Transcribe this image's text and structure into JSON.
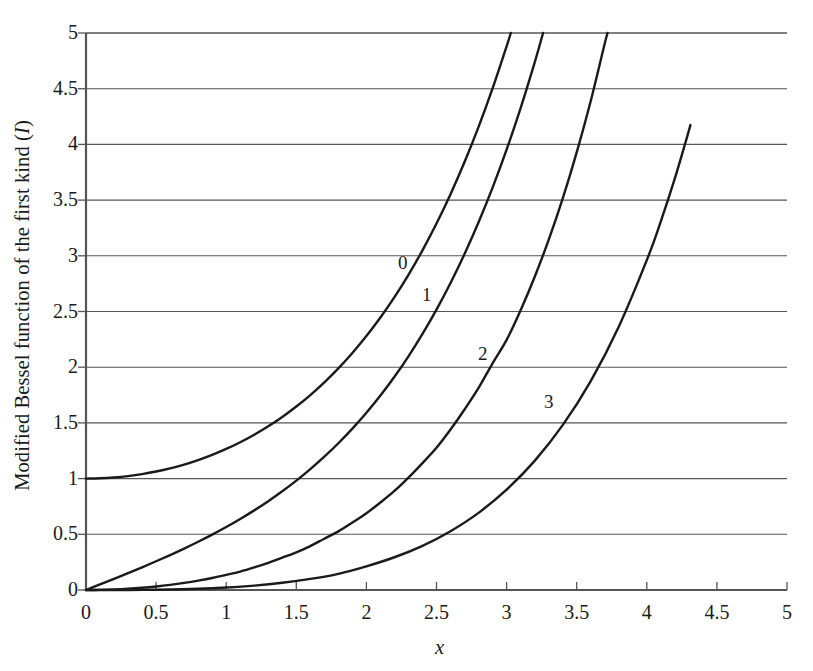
{
  "chart_data": {
    "type": "line",
    "title": "",
    "xlabel": "x",
    "ylabel": "Modified Bessel function of the first kind (I)",
    "ylabel_text": "Modified Bessel function of the first kind",
    "ylabel_symbol": "I",
    "xlim": [
      0,
      5
    ],
    "ylim": [
      0,
      5
    ],
    "xticks": [
      "0",
      "0.5",
      "1",
      "1.5",
      "2",
      "2.5",
      "3",
      "3.5",
      "4",
      "4.5",
      "5"
    ],
    "xtick_values": [
      0,
      0.5,
      1,
      1.5,
      2,
      2.5,
      3,
      3.5,
      4,
      4.5,
      5
    ],
    "yticks": [
      "0",
      "0.5",
      "1",
      "1.5",
      "2",
      "2.5",
      "3",
      "3.5",
      "4",
      "4.5",
      "5"
    ],
    "ytick_values": [
      0,
      0.5,
      1,
      1.5,
      2,
      2.5,
      3,
      3.5,
      4,
      4.5,
      5
    ],
    "grid": "horizontal",
    "legend": "inline-curve-labels",
    "line_color": "#1a1a1a",
    "grid_color": "#555555",
    "axis_color": "#555555",
    "background_color": "#ffffff",
    "series": [
      {
        "name": "0",
        "label": "0",
        "label_x": 2.26,
        "label_y": 2.94,
        "exit_x": 3.03,
        "x": [
          0,
          0.1,
          0.2,
          0.3,
          0.4,
          0.5,
          0.6,
          0.7,
          0.8,
          0.9,
          1.0,
          1.1,
          1.2,
          1.3,
          1.4,
          1.5,
          1.6,
          1.7,
          1.8,
          1.9,
          2.0,
          2.1,
          2.2,
          2.3,
          2.4,
          2.5,
          2.6,
          2.7,
          2.8,
          2.9,
          3.0,
          3.03
        ],
        "values": [
          1.0,
          1.0025,
          1.01,
          1.0226,
          1.0404,
          1.0635,
          1.092,
          1.1263,
          1.1665,
          1.213,
          1.2661,
          1.3262,
          1.3937,
          1.4693,
          1.5534,
          1.6467,
          1.75,
          1.864,
          1.9896,
          2.1277,
          2.2796,
          2.4463,
          2.6291,
          2.8296,
          3.0493,
          3.2898,
          3.5533,
          3.8417,
          4.1573,
          4.5028,
          4.8808,
          5.0
        ]
      },
      {
        "name": "1",
        "label": "1",
        "label_x": 2.43,
        "label_y": 2.66,
        "exit_x": 3.26,
        "x": [
          0,
          0.1,
          0.2,
          0.3,
          0.4,
          0.5,
          0.6,
          0.7,
          0.8,
          0.9,
          1.0,
          1.1,
          1.2,
          1.3,
          1.4,
          1.5,
          1.6,
          1.7,
          1.8,
          1.9,
          2.0,
          2.1,
          2.2,
          2.3,
          2.4,
          2.5,
          2.6,
          2.7,
          2.8,
          2.9,
          3.0,
          3.1,
          3.2,
          3.26
        ],
        "values": [
          0.0,
          0.0501,
          0.1005,
          0.1517,
          0.204,
          0.2579,
          0.3137,
          0.3719,
          0.4329,
          0.4971,
          0.5652,
          0.6375,
          0.7147,
          0.7973,
          0.8861,
          0.9817,
          1.0848,
          1.1963,
          1.3172,
          1.4482,
          1.5906,
          1.7455,
          1.9141,
          2.0978,
          2.2981,
          2.5167,
          2.7554,
          3.0161,
          3.3011,
          3.6126,
          3.9534,
          4.3262,
          4.7343,
          5.0
        ]
      },
      {
        "name": "2",
        "label": "2",
        "label_x": 2.83,
        "label_y": 2.13,
        "exit_x": 3.72,
        "x": [
          0,
          0.1,
          0.2,
          0.3,
          0.4,
          0.5,
          0.6,
          0.7,
          0.8,
          0.9,
          1.0,
          1.1,
          1.2,
          1.3,
          1.4,
          1.5,
          1.6,
          1.7,
          1.8,
          1.9,
          2.0,
          2.1,
          2.2,
          2.3,
          2.4,
          2.5,
          2.6,
          2.7,
          2.8,
          2.9,
          3.0,
          3.1,
          3.2,
          3.3,
          3.4,
          3.5,
          3.6,
          3.7,
          3.72
        ],
        "values": [
          0.0,
          0.0013,
          0.005,
          0.0113,
          0.0203,
          0.0319,
          0.0464,
          0.0637,
          0.0841,
          0.1077,
          0.1357,
          0.1655,
          0.2026,
          0.244,
          0.2903,
          0.3378,
          0.394,
          0.4605,
          0.526,
          0.6054,
          0.6889,
          0.7856,
          0.8891,
          1.0089,
          1.1395,
          1.2765,
          1.4401,
          1.62,
          1.8136,
          2.0352,
          2.2452,
          2.5116,
          2.81,
          3.1426,
          3.513,
          3.9284,
          4.389,
          4.906,
          5.0
        ]
      },
      {
        "name": "3",
        "label": "3",
        "label_x": 3.3,
        "label_y": 1.7,
        "exit_x": 4.31,
        "x": [
          0,
          0.2,
          0.4,
          0.6,
          0.8,
          1.0,
          1.2,
          1.4,
          1.6,
          1.8,
          2.0,
          2.2,
          2.4,
          2.6,
          2.8,
          3.0,
          3.2,
          3.4,
          3.6,
          3.8,
          4.0,
          4.1,
          4.2,
          4.3,
          4.31
        ],
        "values": [
          0.0,
          0.0002,
          0.0013,
          0.0045,
          0.011,
          0.0222,
          0.0394,
          0.0645,
          0.0993,
          0.1454,
          0.2127,
          0.294,
          0.3969,
          0.5282,
          0.6926,
          0.9006,
          1.159,
          1.4796,
          1.8757,
          2.3637,
          2.961,
          3.309,
          3.6949,
          4.123,
          4.171
        ]
      }
    ]
  }
}
